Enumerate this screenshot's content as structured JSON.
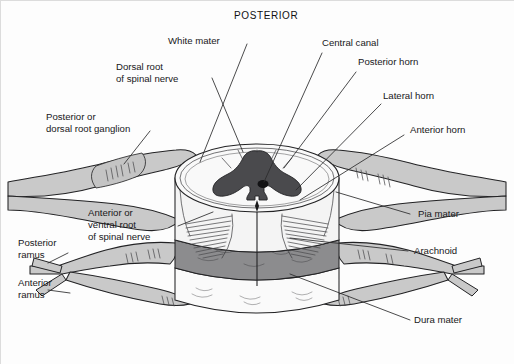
{
  "figure": {
    "title": "POSTERIOR",
    "colors": {
      "background": "#fdfdfd",
      "gray_matter": "#4a4a4d",
      "white_matter": "#f6f6f6",
      "nerve": "#c9c9c9",
      "arachnoid_band": "#8c8c8e",
      "dura_band": "#fafafa",
      "pia_band": "#ededed",
      "outline": "#232325",
      "text": "#18181a"
    }
  },
  "labels": {
    "posterior_title": "POSTERIOR",
    "white_mater": "White mater",
    "dorsal_root_line1": "Dorsal root",
    "dorsal_root_line2": "of spinal nerve",
    "ganglion_line1": "Posterior or",
    "ganglion_line2": "dorsal root ganglion",
    "central_canal": "Central canal",
    "posterior_horn": "Posterior horn",
    "lateral_horn": "Lateral horn",
    "anterior_horn": "Anterior horn",
    "pia_mater": "Pia mater",
    "arachnoid": "Arachnoid",
    "dura_mater": "Dura mater",
    "ventral_root_line1": "Anterior or",
    "ventral_root_line2": "ventral root",
    "ventral_root_line3": "of spinal nerve",
    "posterior_ramus_line1": "Posterior",
    "posterior_ramus_line2": "ramus",
    "anterior_ramus_line1": "Anterior",
    "anterior_ramus_line2": "ramus"
  }
}
